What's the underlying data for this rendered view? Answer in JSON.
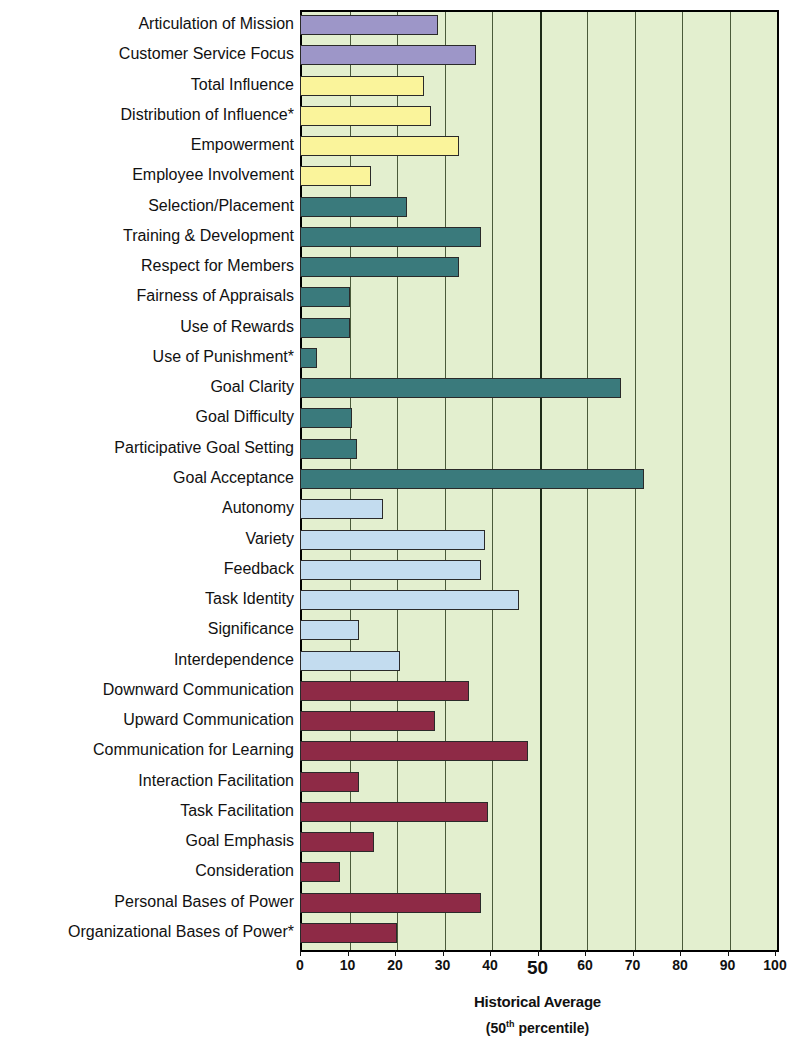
{
  "chart_data": {
    "type": "bar",
    "orientation": "horizontal",
    "title": "",
    "xlabel": "Historical Average (50th percentile)",
    "ylabel": "",
    "xlim": [
      0,
      100
    ],
    "grid": true,
    "legend": "none",
    "categories": [
      "Articulation of Mission",
      "Customer Service Focus",
      "Total Influence",
      "Distribution of Influence*",
      "Empowerment",
      "Employee Involvement",
      "Selection/Placement",
      "Training & Development",
      "Respect for Members",
      "Fairness of Appraisals",
      "Use of Rewards",
      "Use of Punishment*",
      "Goal Clarity",
      "Goal Difficulty",
      "Participative Goal Setting",
      "Goal Acceptance",
      "Autonomy",
      "Variety",
      "Feedback",
      "Task Identity",
      "Significance",
      "Interdependence",
      "Downward Communication",
      "Upward Communication",
      "Communication for Learning",
      "Interaction Facilitation",
      "Task Facilitation",
      "Goal Emphasis",
      "Consideration",
      "Personal Bases of Power",
      "Organizational Bases of Power*"
    ],
    "values": [
      29,
      37,
      26,
      27.5,
      33.5,
      15,
      22.5,
      38,
      33.5,
      10.5,
      10.5,
      3.5,
      67.5,
      11,
      12,
      72.5,
      17.5,
      39,
      38,
      46,
      12.5,
      21,
      35.5,
      28.5,
      48,
      12.5,
      39.5,
      15.5,
      8.5,
      38,
      20.5
    ],
    "bar_colors": [
      "#9D96C8",
      "#9D96C8",
      "#FAF49B",
      "#FAF49B",
      "#FAF49B",
      "#FAF49B",
      "#3A7A7C",
      "#3A7A7C",
      "#3A7A7C",
      "#3A7A7C",
      "#3A7A7C",
      "#3A7A7C",
      "#3A7A7C",
      "#3A7A7C",
      "#3A7A7C",
      "#3A7A7C",
      "#C3DCEF",
      "#C3DCEF",
      "#C3DCEF",
      "#C3DCEF",
      "#C3DCEF",
      "#C3DCEF",
      "#8E2A46",
      "#8E2A46",
      "#8E2A46",
      "#8E2A46",
      "#8E2A46",
      "#8E2A46",
      "#8E2A46",
      "#8E2A46",
      "#8E2A46"
    ],
    "xticks": [
      0,
      10,
      20,
      30,
      40,
      50,
      60,
      70,
      80,
      90,
      100
    ],
    "xtick_labels": [
      "0",
      "10",
      "20",
      "30",
      "40",
      "50",
      "60",
      "70",
      "80",
      "90",
      "100"
    ],
    "emphasized_tick": "50",
    "plot_background": "#E3EFCF",
    "gridline_color": "#4a5a3a",
    "major_gridline_value": 50
  },
  "axis": {
    "title_main": "Historical Average",
    "title_sub_prefix": "(50",
    "title_sub_sup": "th",
    "title_sub_suffix": " percentile)"
  }
}
